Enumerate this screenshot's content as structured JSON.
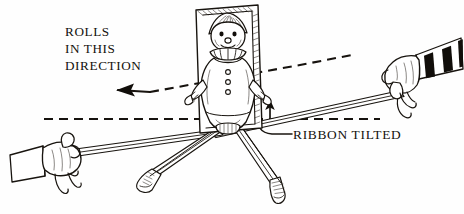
{
  "figure": {
    "background_color": "#fefefe",
    "ink_color": "#18140f",
    "stripe_color": "#110e0a",
    "width": 464,
    "height": 214
  },
  "annotations": {
    "direction_label": {
      "name": "rolls-in-this-direction-label",
      "line1": "ROLLS",
      "line2": "IN THIS",
      "line3": "DIRECTION"
    },
    "ribbon_label": {
      "name": "ribbon-tilted-label",
      "text": "RIBBON TILTED"
    }
  },
  "markers": {
    "direction_arrow": "left-arrow-icon",
    "tilt_arrow": "up-arrow-icon",
    "upper_dashed_guide": "tilted-dashed-reference-line",
    "lower_dashed_guide": "horizontal-dashed-reference-line",
    "leader_line": "curved-leader-line"
  },
  "objects": {
    "clown_panel": {
      "name": "clown-panel",
      "description": "rectangular board with clown figure"
    },
    "clown_figure": {
      "name": "clown-figure",
      "parts": [
        "pointed-hat",
        "face",
        "ruffled-collar",
        "buttons",
        "suit",
        "arms",
        "legs",
        "shoes"
      ]
    },
    "ribbon": {
      "name": "ribbon-strip",
      "description": "long narrow ribbon stretched between two hands"
    },
    "left_hand": {
      "name": "left-hand-holding-ribbon",
      "sleeve": "plain-cuff"
    },
    "right_hand": {
      "name": "right-hand-holding-ribbon",
      "sleeve": "striped-cuff"
    }
  }
}
